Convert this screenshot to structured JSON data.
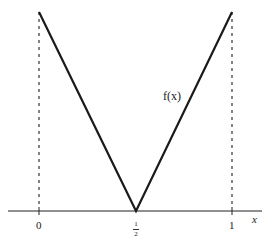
{
  "diagram": {
    "function_label": "f(x)",
    "axis_label": "x",
    "ticks": [
      {
        "label": "0",
        "value": 0
      },
      {
        "label_num": "1",
        "label_den": "2",
        "value": 0.5
      },
      {
        "label": "1",
        "value": 1
      }
    ],
    "points": [
      {
        "x": 0,
        "y": 1
      },
      {
        "x": 0.5,
        "y": 0
      },
      {
        "x": 1,
        "y": 1
      }
    ],
    "line_color": "#1a1a1a",
    "dashed_verticals_at": [
      0,
      1
    ]
  }
}
